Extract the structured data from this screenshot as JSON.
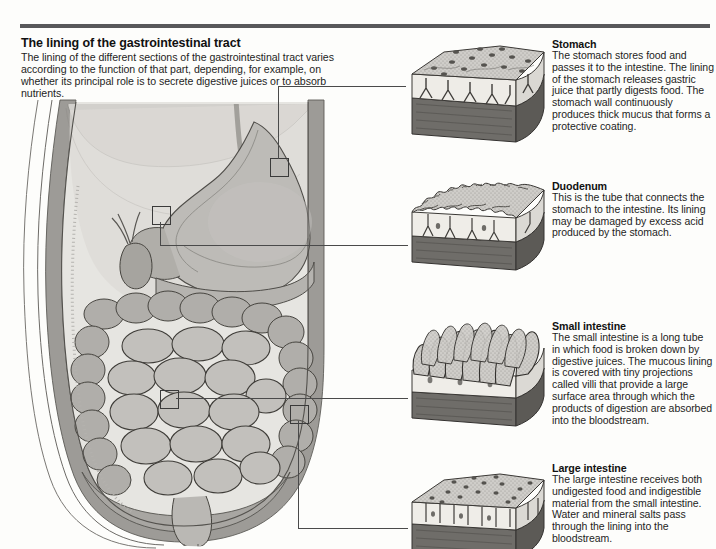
{
  "figure": {
    "title": "The lining of the gastrointestinal tract",
    "intro": "The lining of the different sections of the gastrointestinal tract varies according to the function of that part, depending, for example, on whether its principal role is to secrete digestive juices or to absorb nutrients."
  },
  "sections": [
    {
      "id": "stomach",
      "heading": "Stomach",
      "body": "The stomach stores food and passes it to the intestine. The lining of the stomach releases gastric juice that partly digests food. The stomach wall continuously produces thick mucus that forms a protective coating."
    },
    {
      "id": "duodenum",
      "heading": "Duodenum",
      "body": "This is the tube that connects the stomach to the intestine. Its lining may be damaged by excess acid produced by the stomach."
    },
    {
      "id": "small-intestine",
      "heading": "Small intestine",
      "body": "The small intestine is a long tube in which food is broken down by digestive juices. The mucous lining is covered with tiny projections called villi that provide a large surface area through which the products of digestion are absorbed into the bloodstream."
    },
    {
      "id": "large-intestine",
      "heading": "Large intestine",
      "body": "The large intestine receives both undigested food and indigestible material from the small intestine. Water and mineral salts pass through the lining into the bloodstream."
    }
  ],
  "colors": {
    "rule": "#58585a",
    "mucosa_top": "#b3b1ad",
    "mid_layer": "#ebe9e4",
    "muscle_base": "#6e6e6e",
    "outline": "#2f2f2f",
    "organ_fill": "#b8b6b2",
    "body_wall": "#9a9894",
    "cavity": "#e4e3df"
  }
}
